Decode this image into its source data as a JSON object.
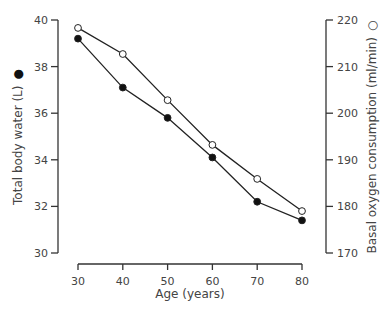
{
  "chart_data": {
    "type": "line",
    "title": "",
    "xlabel": "Age (years)",
    "ylabel": "Total body water (L)",
    "ylabel_marker": "●",
    "y2label": "Basal oxygen consumption (ml/min)",
    "y2label_marker": "○",
    "x": [
      30,
      40,
      50,
      60,
      70,
      80
    ],
    "x_ticks": [
      "30",
      "40",
      "50",
      "60",
      "70",
      "80"
    ],
    "ylim": [
      30,
      40
    ],
    "y_ticks": [
      "30",
      "32",
      "34",
      "36",
      "38",
      "40"
    ],
    "y2lim": [
      170,
      220
    ],
    "y2_ticks": [
      "170",
      "180",
      "190",
      "200",
      "210",
      "220"
    ],
    "grid": false,
    "legend": "none (markers in axis labels)",
    "series": [
      {
        "name": "Total body water (L)",
        "axis": "left",
        "marker": "filled-circle",
        "values": [
          39.2,
          37.1,
          35.8,
          34.1,
          32.2,
          31.4
        ]
      },
      {
        "name": "Basal oxygen consumption (ml/min)",
        "axis": "right",
        "marker": "open-circle",
        "values": [
          218.3,
          212.7,
          202.8,
          193.2,
          185.9,
          179.0
        ]
      }
    ]
  }
}
